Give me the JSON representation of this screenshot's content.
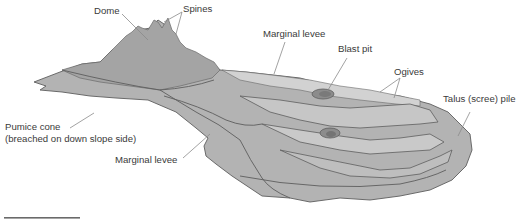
{
  "diagram": {
    "labels": {
      "dome": "Dome",
      "spines": "Spines",
      "marginal_levee_top": "Marginal levee",
      "blast_pit": "Blast pit",
      "ogives": "Ogives",
      "talus": "Talus (scree) pile",
      "pumice_cone_line1": "Pumice cone",
      "pumice_cone_line2": "(breached on down slope side)",
      "marginal_levee_bottom": "Marginal levee"
    },
    "colors": {
      "flow_fill": "#b3b3b3",
      "dome_fill": "#a4a4a4",
      "ogive_fill": "#c6c6c6",
      "levee_fill": "#d2d2d2",
      "pit_fill": "#8c8c8c",
      "outline": "#5e5e5e",
      "label_text": "#3a3a3a",
      "scale_bar": "#6a6a6a"
    }
  }
}
